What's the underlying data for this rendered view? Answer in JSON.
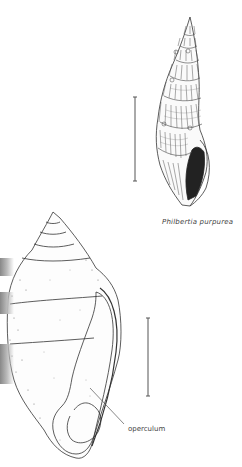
{
  "figure_top": {
    "species_caption": "Philbertia purpurea",
    "scale_bar": {
      "x": 135,
      "y1": 97,
      "y2": 181
    }
  },
  "figure_bottom": {
    "annotation_label": "operculum",
    "scale_bar": {
      "x": 148,
      "y1": 318,
      "y2": 396
    }
  },
  "colors": {
    "ink": "#333333",
    "stipple": "#555555",
    "background": "#ffffff"
  }
}
